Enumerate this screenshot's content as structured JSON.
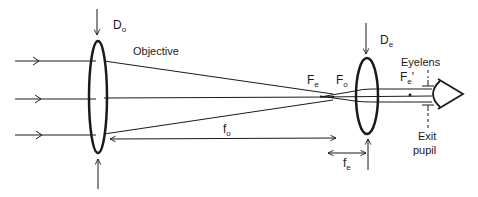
{
  "diagram": {
    "type": "Keplerian telescope ray diagram",
    "labels": {
      "objective_diameter": {
        "main": "D",
        "sub": "o"
      },
      "objective": "Objective",
      "eyepiece_diameter": {
        "main": "D",
        "sub": "e"
      },
      "eyelens": "Eyelens",
      "focal_point_eye": {
        "main": "F",
        "sub": "e"
      },
      "focal_point_obj": {
        "main": "F",
        "sub": "o"
      },
      "focal_point_eye_prime": {
        "main": "F",
        "sub": "e",
        "suffix": "'"
      },
      "objective_focal_length": {
        "main": "f",
        "sub": "o"
      },
      "eyepiece_focal_length": {
        "main": "f",
        "sub": "e"
      },
      "exit_pupil_line1": "Exit",
      "exit_pupil_line2": "pupil"
    },
    "colors": {
      "line": "#1a1a1a",
      "background": "#ffffff"
    }
  }
}
